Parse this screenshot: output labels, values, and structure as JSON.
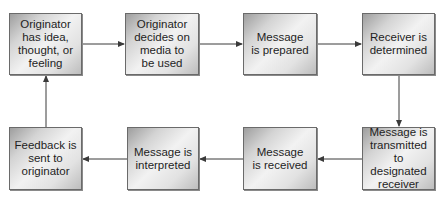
{
  "diagram": {
    "type": "flowchart",
    "nodes": [
      {
        "id": "n1",
        "label": "Originator\nhas idea,\nthought, or\nfeeling"
      },
      {
        "id": "n2",
        "label": "Originator\ndecides on\nmedia to\nbe used"
      },
      {
        "id": "n3",
        "label": "Message\nis prepared"
      },
      {
        "id": "n4",
        "label": "Receiver is\ndetermined"
      },
      {
        "id": "n5",
        "label": "Message is\ntransmitted\nto designated\nreceiver"
      },
      {
        "id": "n6",
        "label": "Message\nis received"
      },
      {
        "id": "n7",
        "label": "Message is\ninterpreted"
      },
      {
        "id": "n8",
        "label": "Feedback is\nsent to\noriginator"
      }
    ],
    "edges": [
      {
        "from": "n1",
        "to": "n2"
      },
      {
        "from": "n2",
        "to": "n3"
      },
      {
        "from": "n3",
        "to": "n4"
      },
      {
        "from": "n4",
        "to": "n5"
      },
      {
        "from": "n5",
        "to": "n6"
      },
      {
        "from": "n6",
        "to": "n7"
      },
      {
        "from": "n7",
        "to": "n8"
      },
      {
        "from": "n8",
        "to": "n1"
      }
    ],
    "colors": {
      "border": "#6a6a6a",
      "arrow": "#3a3a3a",
      "text": "#1e1e1e"
    }
  }
}
